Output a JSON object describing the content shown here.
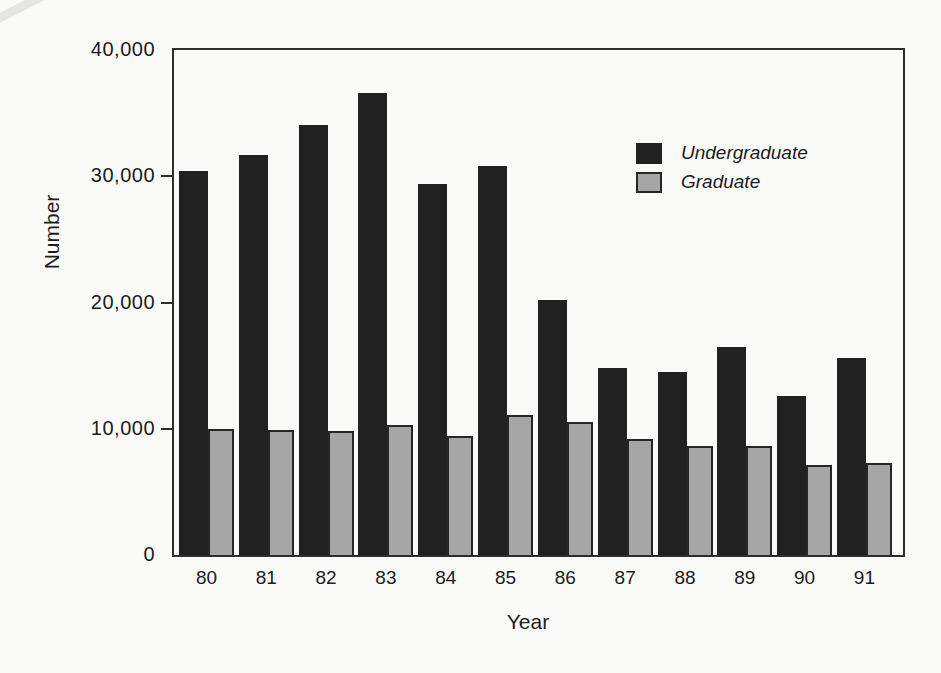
{
  "page": {
    "background": "#fafaf8",
    "text_color": "#1c1c1c",
    "axis_color": "#2e2e2e"
  },
  "chart_data": {
    "type": "bar",
    "title": "",
    "xlabel": "Year",
    "ylabel": "Number",
    "categories": [
      "80",
      "81",
      "82",
      "83",
      "84",
      "85",
      "86",
      "87",
      "88",
      "89",
      "90",
      "91"
    ],
    "series": [
      {
        "name": "Undergraduate",
        "color": "#212121",
        "fill_style": "solid",
        "values": [
          30400,
          31700,
          34100,
          36600,
          29400,
          30800,
          20200,
          14800,
          14500,
          16500,
          12600,
          15600
        ]
      },
      {
        "name": "Graduate",
        "color": "#a6a6a6",
        "fill_style": "halftone-dots",
        "border_color": "#262626",
        "values": [
          10000,
          9900,
          9800,
          10300,
          9400,
          11100,
          10500,
          9200,
          8600,
          8600,
          7100,
          7300
        ]
      }
    ],
    "ylim": [
      0,
      40000
    ],
    "yticks": [
      {
        "value": 0,
        "label": "0"
      },
      {
        "value": 10000,
        "label": "10,000"
      },
      {
        "value": 20000,
        "label": "20,000"
      },
      {
        "value": 30000,
        "label": "30,000"
      },
      {
        "value": 40000,
        "label": "40,000"
      }
    ],
    "grid": false,
    "legend": {
      "position": "inside-upper-right",
      "italic": true
    }
  }
}
